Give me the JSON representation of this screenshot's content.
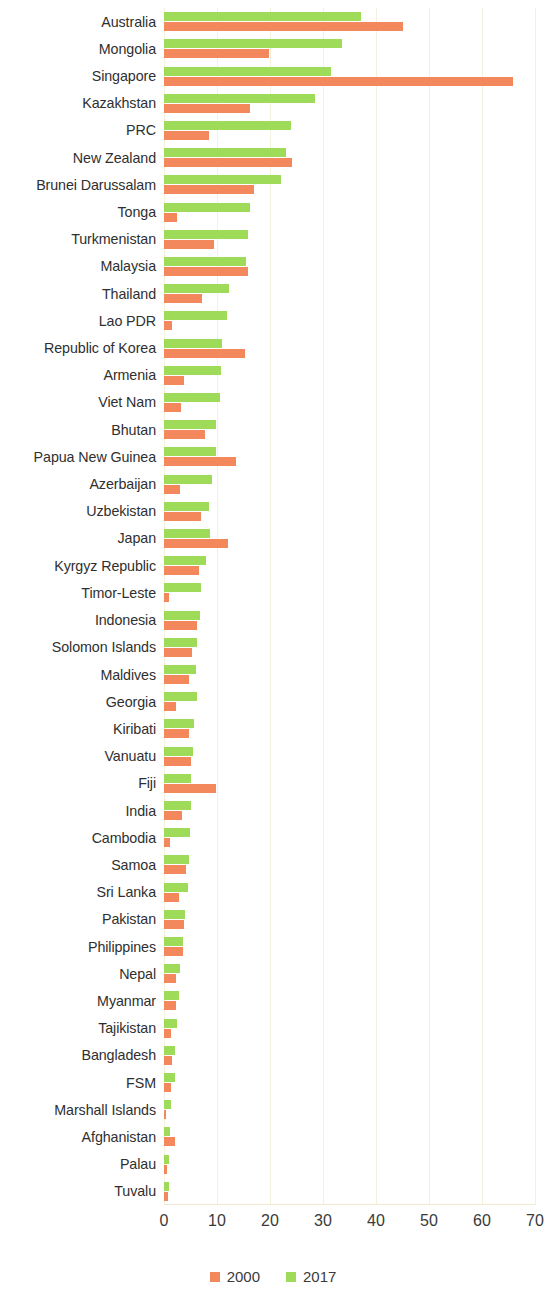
{
  "chart_data": {
    "type": "bar",
    "orientation": "horizontal",
    "title": "",
    "xlabel": "",
    "ylabel": "",
    "xlim": [
      0,
      70
    ],
    "xticks": [
      0,
      10,
      20,
      30,
      40,
      50,
      60,
      70
    ],
    "grid": "vertical",
    "legend_position": "bottom-center",
    "colors": {
      "2000": "#f2885b",
      "2017": "#9ddb58"
    },
    "categories": [
      "Australia",
      "Mongolia",
      "Singapore",
      "Kazakhstan",
      "PRC",
      "New Zealand",
      "Brunei Darussalam",
      "Tonga",
      "Turkmenistan",
      "Malaysia",
      "Thailand",
      "Lao PDR",
      "Republic of Korea",
      "Armenia",
      "Viet Nam",
      "Bhutan",
      "Papua New Guinea",
      "Azerbaijan",
      "Uzbekistan",
      "Japan",
      "Kyrgyz Republic",
      "Timor-Leste",
      "Indonesia",
      "Solomon Islands",
      "Maldives",
      "Georgia",
      "Kiribati",
      "Vanuatu",
      "Fiji",
      "India",
      "Cambodia",
      "Samoa",
      "Sri Lanka",
      "Pakistan",
      "Philippines",
      "Nepal",
      "Myanmar",
      "Tajikistan",
      "Bangladesh",
      "FSM",
      "Marshall Islands",
      "Afghanistan",
      "Palau",
      "Tuvalu"
    ],
    "series": [
      {
        "name": "2000",
        "color": "#f2885b",
        "values": [
          45.0,
          19.8,
          65.8,
          16.2,
          8.5,
          24.2,
          17.0,
          2.4,
          9.5,
          15.8,
          7.1,
          1.6,
          15.3,
          3.8,
          3.2,
          7.8,
          13.6,
          3.0,
          7.0,
          12.0,
          6.6,
          0.9,
          6.2,
          5.3,
          4.7,
          2.3,
          4.8,
          5.0,
          9.9,
          3.4,
          1.2,
          4.2,
          2.8,
          3.8,
          3.6,
          2.2,
          2.3,
          1.4,
          1.5,
          1.4,
          0.2,
          2.0,
          0.5,
          0.7
        ]
      },
      {
        "name": "2017",
        "color": "#9ddb58",
        "values": [
          37.2,
          33.6,
          31.5,
          28.5,
          24.0,
          23.1,
          22.0,
          16.3,
          15.8,
          15.5,
          12.3,
          11.8,
          10.9,
          10.7,
          10.6,
          9.9,
          9.8,
          9.0,
          8.4,
          8.7,
          8.0,
          7.0,
          6.8,
          6.3,
          6.1,
          6.2,
          5.6,
          5.4,
          5.0,
          5.1,
          4.9,
          4.7,
          4.6,
          4.0,
          3.5,
          3.0,
          2.9,
          2.4,
          2.1,
          2.0,
          1.4,
          1.1,
          1.0,
          0.9
        ]
      }
    ]
  },
  "axis": {
    "tick_labels": [
      "0",
      "10",
      "20",
      "30",
      "40",
      "50",
      "60",
      "70"
    ]
  },
  "legend": {
    "items": [
      {
        "label": "2000",
        "color": "#f2885b",
        "swatch": "square-swatch-2000"
      },
      {
        "label": "2017",
        "color": "#9ddb58",
        "swatch": "square-swatch-2017"
      }
    ]
  }
}
